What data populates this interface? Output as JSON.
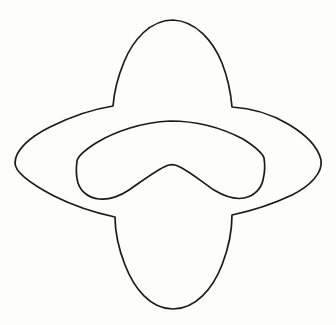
{
  "image": {
    "kind": "line-drawing",
    "title": "Four-pointed star outline with chevron-shaped inner hole",
    "background_color": "#fdfdfc",
    "ink_color": "#1a1a1a",
    "stroke_width": 1.7,
    "width": 336,
    "height": 325,
    "style": "hand-drawn single-weight contour, no shading, no text labels",
    "visible_text": ""
  },
  "shapes": {
    "outer": {
      "name": "four-pointed-star-outline",
      "description": "Wide horizontal lens/ellipse crossed by a tall vertical lobe, forming four rounded points with concave notches at the four inner corners",
      "extremes": {
        "left_point_x": 15,
        "left_point_y": 163,
        "right_point_x": 322,
        "right_point_y": 160,
        "top_point_x": 173,
        "top_point_y": 20,
        "bottom_point_x": 172,
        "bottom_point_y": 309
      },
      "notch_corners": [
        {
          "name": "upper-left-notch",
          "x": 113,
          "y": 106
        },
        {
          "name": "upper-right-notch",
          "x": 232,
          "y": 108
        },
        {
          "name": "lower-right-notch",
          "x": 232,
          "y": 216
        },
        {
          "name": "lower-left-notch",
          "x": 115,
          "y": 218
        }
      ],
      "path": "M 173 20 C 196 21 213 41 222 63 C 229 81 231 95 232 107 C 250 108 271 114 288 124 C 305 134 318 147 321 160 C 323 173 310 186 292 195 C 271 205 251 211 232 215 C 232 229 229 247 222 265 C 213 288 196 309 173 309 C 150 309 134 288 125 265 C 118 247 115 231 115 217 C 96 213 74 206 54 196 C 33 185 15 173 15 163 C 15 150 30 137 50 127 C 70 117 94 109 113 106 C 114 93 117 79 124 62 C 133 40 150 20 173 20 Z"
    },
    "inner": {
      "name": "chevron-hole-outline",
      "description": "Boomerang / wide chevron with rounded left and right tips and an upward-pointing V notch at the bottom centre",
      "extremes": {
        "top_x": 170,
        "top_y": 121,
        "left_tip_x": 77,
        "left_tip_y": 160,
        "right_tip_x": 264,
        "right_tip_y": 157,
        "v_apex_x": 172,
        "v_apex_y": 166,
        "left_bottom_y": 197,
        "right_bottom_y": 196
      },
      "path": "M 170 121 C 142 122 114 132 96 143 C 85 150 78 156 77 161 C 76 168 76 176 78 183 C 81 192 89 198 99 199 C 110 200 120 196 129 190 C 142 181 154 172 164 167 C 169 164 175 164 180 167 C 190 172 201 181 214 190 C 224 196 234 200 244 198 C 254 196 261 189 263 180 C 265 172 265 164 264 158 C 262 152 254 146 243 139 C 224 129 198 121 170 121 Z"
    }
  }
}
